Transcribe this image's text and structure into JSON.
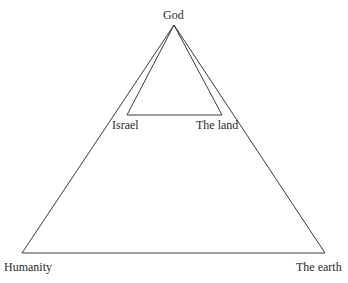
{
  "diagram": {
    "type": "nested-triangles",
    "line_color": "#3a3a3a",
    "nodes": {
      "apex": {
        "label": "God"
      },
      "inner_left": {
        "label": "Israel"
      },
      "inner_right": {
        "label": "The land"
      },
      "outer_left": {
        "label": "Humanity"
      },
      "outer_right": {
        "label": "The earth"
      }
    },
    "edges": [
      [
        "God",
        "Israel"
      ],
      [
        "God",
        "The land"
      ],
      [
        "Israel",
        "The land"
      ],
      [
        "God",
        "Humanity"
      ],
      [
        "God",
        "The earth"
      ],
      [
        "Humanity",
        "The earth"
      ]
    ]
  }
}
